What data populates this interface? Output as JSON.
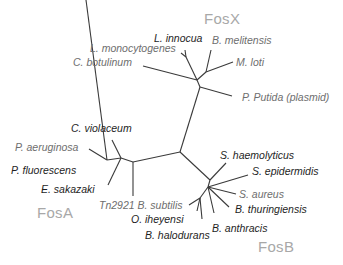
{
  "diagram": {
    "type": "unrooted phylogenetic tree",
    "groups": {
      "fosx": "FosX",
      "fosa": "FosA",
      "fosb": "FosB"
    },
    "labels": {
      "l_innocua": "L. innocua",
      "b_melitensis": "B. melitensis",
      "l_monocytogenes": "L. monocytogenes",
      "c_botulinum": "C. botulinum",
      "m_loti": "M. loti",
      "p_putida": "P. Putida (plasmid)",
      "c_violaceum": "C. violaceum",
      "p_aeruginosa": "P. aeruginosa",
      "p_fluorescens": "P. fluorescens",
      "e_sakazaki": "E. sakazaki",
      "tn2921": "Tn2921 B. subtilis",
      "o_iheyensi": "O. iheyensi",
      "b_halodurans": "B. halodurans",
      "b_anthracis": "B. anthracis",
      "s_haemolyticus": "S. haemolyticus",
      "s_epidermidis": "S. epidermidis",
      "s_aureus": "S. aureus",
      "b_thuringiensis": "B. thuringiensis"
    },
    "colors": {
      "branch": "#3a3a3a",
      "label_dark": "#1e1e1e",
      "label_gray": "#6e6e6e",
      "group_label": "#a8a8a8"
    }
  }
}
